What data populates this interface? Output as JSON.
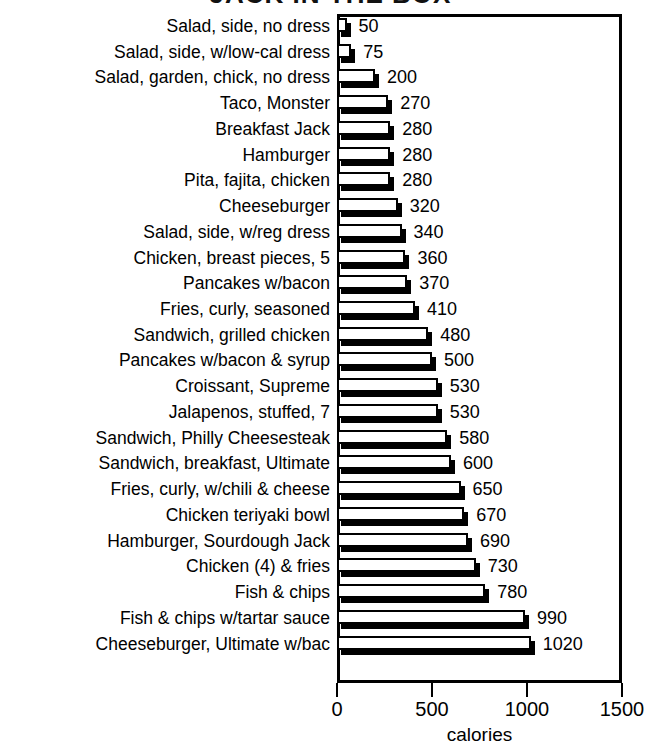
{
  "chart_data": {
    "type": "bar",
    "orientation": "horizontal",
    "title": "JACK IN THE BOX",
    "title_note": "title is cropped off the top edge of the screenshot",
    "xlabel": "calories",
    "ylabel": "",
    "xlim": [
      0,
      1500
    ],
    "xticks": [
      0,
      500,
      1000,
      1500
    ],
    "xtick_labels": [
      "0",
      "500",
      "1000",
      "1500"
    ],
    "grid": false,
    "legend": null,
    "value_labels": true,
    "bar_style": {
      "fill": "#ffffff",
      "edge": "#000000",
      "shadow": "#000000",
      "shadow_offset_px": 4
    },
    "categories": [
      "Salad, side, no dress",
      "Salad, side, w/low-cal dress",
      "Salad, garden, chick, no dress",
      "Taco, Monster",
      "Breakfast Jack",
      "Hamburger",
      "Pita, fajita, chicken",
      "Cheeseburger",
      "Salad, side, w/reg dress",
      "Chicken, breast pieces, 5",
      "Pancakes w/bacon",
      "Fries, curly, seasoned",
      "Sandwich, grilled chicken",
      "Pancakes w/bacon & syrup",
      "Croissant, Supreme",
      "Jalapenos, stuffed, 7",
      "Sandwich, Philly Cheesesteak",
      "Sandwich, breakfast, Ultimate",
      "Fries, curly, w/chili & cheese",
      "Chicken teriyaki bowl",
      "Hamburger, Sourdough Jack",
      "Chicken (4) & fries",
      "Fish & chips",
      "Fish & chips w/tartar sauce",
      "Cheeseburger, Ultimate w/bac"
    ],
    "values": [
      50,
      75,
      200,
      270,
      280,
      280,
      280,
      320,
      340,
      360,
      370,
      410,
      480,
      500,
      530,
      530,
      580,
      600,
      650,
      670,
      690,
      730,
      780,
      990,
      1020
    ],
    "value_text": [
      "50",
      "75",
      "200",
      "270",
      "280",
      "280",
      "280",
      "320",
      "340",
      "360",
      "370",
      "410",
      "480",
      "500",
      "530",
      "530",
      "580",
      "600",
      "650",
      "670",
      "690",
      "730",
      "780",
      "990",
      "1020"
    ]
  }
}
